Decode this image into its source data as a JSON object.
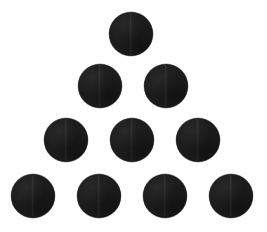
{
  "figure": {
    "shape_count": 10,
    "row_counts": [
      1,
      2,
      3,
      4
    ],
    "background_color": "#fefefe",
    "dot_color": "#1c1c1c",
    "canvas": {
      "width": 267,
      "height": 232
    },
    "geometry": {
      "dot_diameter": 44,
      "row_spacing": 54,
      "column_spacing": 66,
      "first_row_center_y": 34,
      "apex_center_x": 131
    },
    "dots": [
      {
        "id": "dot-r1-c1",
        "row": 1,
        "index": 1,
        "cx": 131,
        "cy": 34,
        "d": 44
      },
      {
        "id": "dot-r2-c1",
        "row": 2,
        "index": 1,
        "cx": 100,
        "cy": 86,
        "d": 44
      },
      {
        "id": "dot-r2-c2",
        "row": 2,
        "index": 2,
        "cx": 166,
        "cy": 86,
        "d": 44
      },
      {
        "id": "dot-r3-c1",
        "row": 3,
        "index": 1,
        "cx": 66,
        "cy": 140,
        "d": 44
      },
      {
        "id": "dot-r3-c2",
        "row": 3,
        "index": 2,
        "cx": 132,
        "cy": 140,
        "d": 44
      },
      {
        "id": "dot-r3-c3",
        "row": 3,
        "index": 3,
        "cx": 198,
        "cy": 140,
        "d": 44
      },
      {
        "id": "dot-r4-c1",
        "row": 4,
        "index": 1,
        "cx": 33,
        "cy": 196,
        "d": 44
      },
      {
        "id": "dot-r4-c2",
        "row": 4,
        "index": 2,
        "cx": 99,
        "cy": 196,
        "d": 44
      },
      {
        "id": "dot-r4-c3",
        "row": 4,
        "index": 3,
        "cx": 165,
        "cy": 196,
        "d": 44
      },
      {
        "id": "dot-r4-c4",
        "row": 4,
        "index": 4,
        "cx": 231,
        "cy": 196,
        "d": 44
      }
    ]
  }
}
